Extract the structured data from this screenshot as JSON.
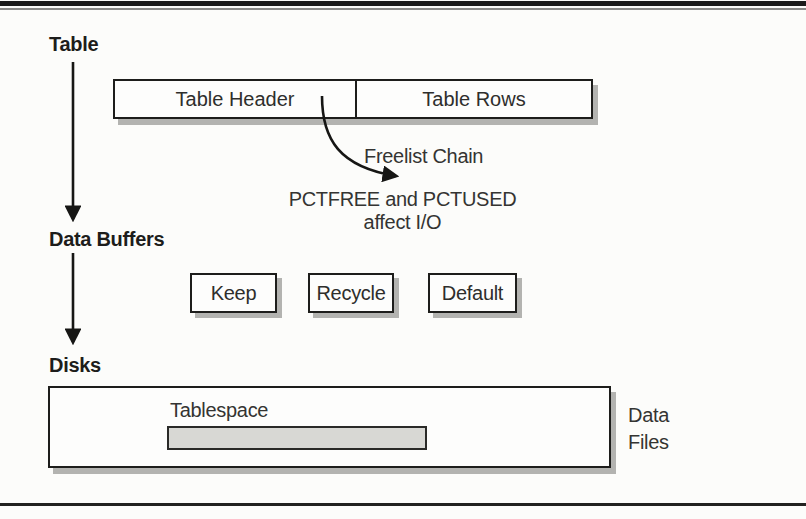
{
  "figure": {
    "type": "database-io-flow-diagram",
    "colors": {
      "background": "#fcfcfa",
      "ink": "#1d1d1b",
      "box_fill": "#fdfdfc",
      "shadow": "#b3b3b0",
      "tablespace_bar_fill": "#d8d8d4"
    }
  },
  "labels": {
    "table": "Table",
    "data_buffers": "Data Buffers",
    "disks": "Disks"
  },
  "table_block": {
    "header": "Table Header",
    "rows": "Table Rows"
  },
  "freelist": {
    "label": "Freelist Chain",
    "note_line1": "PCTFREE and PCTUSED",
    "note_line2": "affect I/O"
  },
  "buffers": [
    "Keep",
    "Recycle",
    "Default"
  ],
  "disk_block": {
    "tablespace_label": "Tablespace",
    "data_files_line1": "Data",
    "data_files_line2": "Files"
  }
}
